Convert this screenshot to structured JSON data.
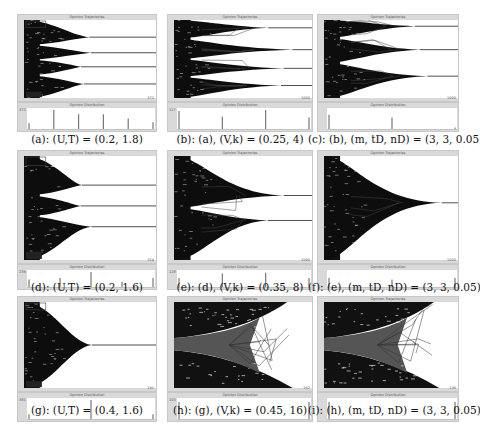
{
  "figure": {
    "panel_titles": {
      "trajectory": "Opinion Trajectories",
      "distribution": "Opinion Distribution"
    },
    "panels": [
      {
        "id": "a",
        "caption": "(a): (U,T) = (0.2, 1.8)",
        "x_max": "372",
        "dist_max": "372",
        "clusters": [
          0.22,
          0.42,
          0.6,
          0.82
        ],
        "spread": "narrow",
        "extremes": true,
        "bars": [
          0.3,
          1.0,
          0.78,
          0.78,
          0.55,
          0.35
        ]
      },
      {
        "id": "b",
        "caption": "(b): (a), (V,k) = (0.25, 4)",
        "x_max": "1000",
        "dist_max": "127",
        "clusters": [
          0.1,
          0.38,
          0.62,
          0.84
        ],
        "spread": "wide",
        "extremes": false,
        "bars": [
          0.95,
          0.65,
          1.0,
          0.6
        ]
      },
      {
        "id": "c",
        "caption": "(c): (b), (m, tD, nD) = (3, 3, 0.05)",
        "x_max": "1000",
        "dist_max": "",
        "clusters": [
          0.08,
          0.38,
          0.72
        ],
        "spread": "wide",
        "extremes": false,
        "bars": [
          0.75,
          0.6,
          0.08
        ]
      },
      {
        "id": "d",
        "caption": "(d): (U,T) = (0.2, 1.6)",
        "x_max": "314",
        "dist_max": "239",
        "clusters": [
          0.28,
          0.48,
          0.68
        ],
        "spread": "narrow",
        "extremes": true,
        "bars": [
          0.5,
          0.6,
          1.0,
          0.35,
          0.6
        ]
      },
      {
        "id": "e",
        "caption": "(e): (d), (V,k) = (0.35, 8)",
        "x_max": "1000",
        "dist_max": "128",
        "clusters": [
          0.38,
          0.62
        ],
        "spread": "wide",
        "extremes": false,
        "bars": [
          0.6,
          0.9,
          0.95,
          0.6
        ]
      },
      {
        "id": "f",
        "caption": "(f): (e), (m, tD, nD) = (3, 3, 0.05)",
        "x_max": "1000",
        "dist_max": "",
        "clusters": [
          0.45
        ],
        "spread": "wide",
        "extremes": false,
        "bars": [
          0.6,
          0.5,
          0.6
        ]
      },
      {
        "id": "g",
        "caption": "(g): (U,T) = (0.4, 1.6)",
        "x_max": "191",
        "dist_max": "381",
        "clusters": [
          0.5
        ],
        "spread": "narrow",
        "extremes": true,
        "bars": [
          0.25,
          1.0,
          0.25
        ]
      },
      {
        "id": "h",
        "caption": "(h): (g), (V,k) = (0.45, 16)",
        "x_max": "162",
        "dist_max": "103",
        "clusters": [
          0.03,
          0.97
        ],
        "spread": "split",
        "extremes": false,
        "bars": [
          0.9,
          0.9
        ]
      },
      {
        "id": "i",
        "caption": "(i): (h), (m, tD, nD) = (3, 3, 0.05)",
        "x_max": "136",
        "dist_max": "",
        "clusters": [
          0.03,
          0.97
        ],
        "spread": "split",
        "extremes": false,
        "bars": [
          0.9,
          0.9
        ]
      }
    ]
  }
}
